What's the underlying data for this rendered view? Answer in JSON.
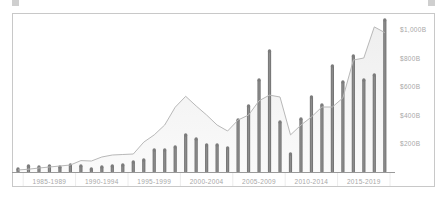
{
  "chart_data": {
    "type": "bar",
    "title": "",
    "xlabel": "",
    "ylabel": "",
    "ylim": [
      0,
      1100
    ],
    "grid": false,
    "legend": "none",
    "x_group_labels": [
      "1985-1989",
      "1990-1994",
      "1995-1999",
      "2000-2004",
      "2005-2009",
      "2010-2014",
      "2015-2019"
    ],
    "y_tick_labels": [
      "$200B",
      "$400B",
      "$600B",
      "$800B",
      "$1,000B"
    ],
    "y_tick_values": [
      200,
      400,
      600,
      800,
      1000
    ],
    "categories": [
      "1984",
      "1985",
      "1986",
      "1987",
      "1988",
      "1989",
      "1990",
      "1991",
      "1992",
      "1993",
      "1994",
      "1995",
      "1996",
      "1997",
      "1998",
      "1999",
      "2000",
      "2001",
      "2002",
      "2003",
      "2004",
      "2005",
      "2006",
      "2007",
      "2008",
      "2009",
      "2010",
      "2011",
      "2012",
      "2013",
      "2014",
      "2015",
      "2016",
      "2017",
      "2018",
      "2019"
    ],
    "series": [
      {
        "name": "bars",
        "type": "bar",
        "color": "#7a7a7a",
        "values": [
          21,
          42,
          35,
          42,
          35,
          49,
          42,
          21,
          35,
          42,
          49,
          70,
          84,
          154,
          154,
          175,
          260,
          232,
          189,
          189,
          168,
          365,
          463,
          646,
          849,
          351,
          126,
          372,
          526,
          470,
          744,
          632,
          814,
          646,
          681,
          1067
        ]
      },
      {
        "name": "line",
        "type": "area-line",
        "color": "#b8b8b8",
        "values": [
          14,
          20,
          28,
          35,
          42,
          49,
          80,
          77,
          105,
          119,
          123,
          126,
          210,
          260,
          330,
          455,
          531,
          463,
          400,
          330,
          288,
          365,
          400,
          500,
          540,
          526,
          260,
          330,
          386,
          456,
          456,
          520,
          786,
          800,
          1018,
          978
        ]
      }
    ]
  }
}
